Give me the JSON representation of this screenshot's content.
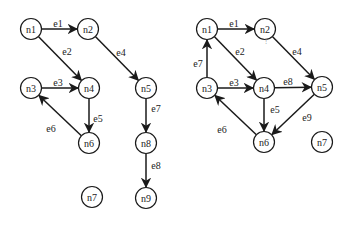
{
  "graphs": [
    {
      "id": "left-graph",
      "nodes": [
        "n1",
        "n2",
        "n3",
        "n4",
        "n5",
        "n6",
        "n7",
        "n8",
        "n9"
      ],
      "edges": [
        {
          "label": "e1",
          "from": "n1",
          "to": "n2"
        },
        {
          "label": "e2",
          "from": "n1",
          "to": "n4"
        },
        {
          "label": "e3",
          "from": "n3",
          "to": "n4"
        },
        {
          "label": "e4",
          "from": "n2",
          "to": "n5"
        },
        {
          "label": "e5",
          "from": "n4",
          "to": "n6"
        },
        {
          "label": "e6",
          "from": "n6",
          "to": "n3"
        },
        {
          "label": "e7",
          "from": "n5",
          "to": "n8"
        },
        {
          "label": "e8",
          "from": "n8",
          "to": "n9"
        }
      ]
    },
    {
      "id": "right-graph",
      "nodes": [
        "n1",
        "n2",
        "n3",
        "n4",
        "n5",
        "n6",
        "n7"
      ],
      "edges": [
        {
          "label": "e1",
          "from": "n1",
          "to": "n2"
        },
        {
          "label": "e2",
          "from": "n1",
          "to": "n4"
        },
        {
          "label": "e3",
          "from": "n3",
          "to": "n4"
        },
        {
          "label": "e4",
          "from": "n2",
          "to": "n5"
        },
        {
          "label": "e5",
          "from": "n4",
          "to": "n6"
        },
        {
          "label": "e6",
          "from": "n6",
          "to": "n3"
        },
        {
          "label": "e7",
          "from": "n3",
          "to": "n1"
        },
        {
          "label": "e8",
          "from": "n4",
          "to": "n5"
        },
        {
          "label": "e9",
          "from": "n5",
          "to": "n6"
        }
      ],
      "annotations": [
        {
          "text": "!",
          "near": "n2"
        }
      ]
    }
  ]
}
